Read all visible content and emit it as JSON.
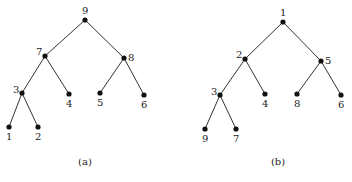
{
  "diagram": {
    "type": "binary-trees",
    "trees": [
      {
        "caption": "(a)",
        "nodes": [
          {
            "id": "9",
            "label": "9",
            "x": 85,
            "y": 20,
            "lx": 82,
            "ly": 14
          },
          {
            "id": "7",
            "label": "7",
            "x": 45,
            "y": 56,
            "lx": 36,
            "ly": 55
          },
          {
            "id": "8",
            "label": "8",
            "x": 124,
            "y": 58,
            "lx": 128,
            "ly": 61
          },
          {
            "id": "3",
            "label": "3",
            "x": 22,
            "y": 93,
            "lx": 13,
            "ly": 93
          },
          {
            "id": "4",
            "label": "4",
            "x": 69,
            "y": 94,
            "lx": 66,
            "ly": 107
          },
          {
            "id": "5",
            "label": "5",
            "x": 100,
            "y": 93,
            "lx": 97,
            "ly": 106
          },
          {
            "id": "6",
            "label": "6",
            "x": 144,
            "y": 95,
            "lx": 141,
            "ly": 108
          },
          {
            "id": "1",
            "label": "1",
            "x": 9,
            "y": 127,
            "lx": 6,
            "ly": 140
          },
          {
            "id": "2",
            "label": "2",
            "x": 38,
            "y": 127,
            "lx": 35,
            "ly": 140
          }
        ],
        "edges": [
          [
            "9",
            "7"
          ],
          [
            "9",
            "8"
          ],
          [
            "7",
            "3"
          ],
          [
            "7",
            "4"
          ],
          [
            "8",
            "5"
          ],
          [
            "8",
            "6"
          ],
          [
            "3",
            "1"
          ],
          [
            "3",
            "2"
          ]
        ],
        "caption_pos": {
          "x": 85,
          "y": 165
        }
      },
      {
        "caption": "(b)",
        "nodes": [
          {
            "id": "1",
            "label": "1",
            "x": 283,
            "y": 22,
            "lx": 280,
            "ly": 16
          },
          {
            "id": "2",
            "label": "2",
            "x": 245,
            "y": 59,
            "lx": 236,
            "ly": 58
          },
          {
            "id": "5",
            "label": "5",
            "x": 321,
            "y": 61,
            "lx": 325,
            "ly": 64
          },
          {
            "id": "3",
            "label": "3",
            "x": 220,
            "y": 95,
            "lx": 211,
            "ly": 95
          },
          {
            "id": "4",
            "label": "4",
            "x": 265,
            "y": 94,
            "lx": 262,
            "ly": 107
          },
          {
            "id": "8",
            "label": "8",
            "x": 297,
            "y": 94,
            "lx": 294,
            "ly": 107
          },
          {
            "id": "6",
            "label": "6",
            "x": 341,
            "y": 95,
            "lx": 338,
            "ly": 108
          },
          {
            "id": "9",
            "label": "9",
            "x": 205,
            "y": 129,
            "lx": 202,
            "ly": 142
          },
          {
            "id": "7",
            "label": "7",
            "x": 236,
            "y": 129,
            "lx": 233,
            "ly": 142
          }
        ],
        "edges": [
          [
            "1",
            "2"
          ],
          [
            "1",
            "5"
          ],
          [
            "2",
            "3"
          ],
          [
            "2",
            "4"
          ],
          [
            "5",
            "8"
          ],
          [
            "5",
            "6"
          ],
          [
            "3",
            "9"
          ],
          [
            "3",
            "7"
          ]
        ],
        "caption_pos": {
          "x": 278,
          "y": 165
        }
      }
    ]
  }
}
